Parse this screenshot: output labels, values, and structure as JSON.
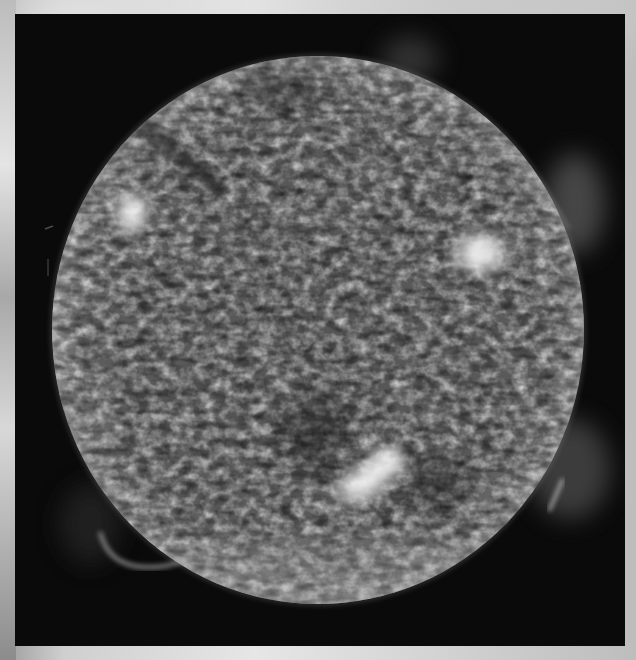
{
  "image": {
    "subject": "solar disk",
    "description": "Grayscale ultraviolet image of the Sun showing granular surface texture, three bright active regions, a dark filament in the upper-left, coronal plumes on the right limb and a prominence loop on the lower-left limb",
    "colors": {
      "backdrop": "#d6d6d6",
      "frame": "#0a0a0a",
      "disk_mid": "#6e6e6e",
      "disk_dark": "#2a2a2a",
      "highlight": "#ffffff"
    },
    "disk": {
      "cx": 303,
      "cy": 316,
      "rx": 266,
      "ry": 274
    },
    "active_regions": [
      {
        "name": "upper-left",
        "cx": 117,
        "cy": 199,
        "r": 22
      },
      {
        "name": "upper-right",
        "cx": 465,
        "cy": 239,
        "r": 32
      },
      {
        "name": "lower-center",
        "cx": 354,
        "cy": 461,
        "r": 40
      }
    ]
  }
}
